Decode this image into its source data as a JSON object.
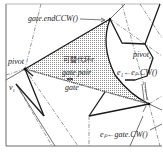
{
  "figure": {
    "labels": {
      "gate_end_ccw": "gate.endCCW()",
      "pivot": "pivot",
      "pivot_e": "pivot",
      "pivot_e_sub": "e",
      "replaceable_ring": "可替代环r",
      "gate_pair": "gate pair",
      "gate": "gate",
      "v1": "v",
      "v1_sub": "1",
      "e1_label": "e₁←eₚ.CW()",
      "ep_label": "eₚ←gate.CW()"
    },
    "colors": {
      "line": "#1a1a1a",
      "dashdot": "#555555",
      "hatch": "#9a9a9a",
      "frame": "#444444",
      "background": "#ffffff"
    }
  }
}
